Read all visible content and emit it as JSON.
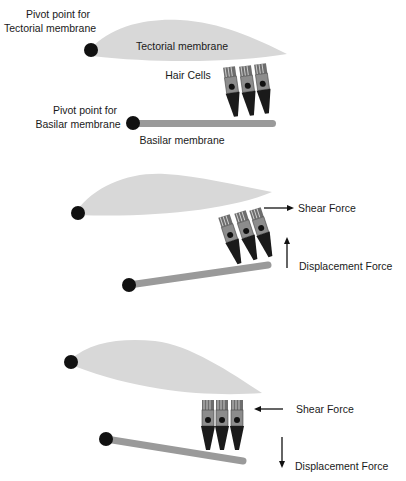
{
  "panel1": {
    "pivot_tectorial_line1": "Pivot point for",
    "pivot_tectorial_line2": "Tectorial membrane",
    "tectorial_label": "Tectorial membrane",
    "hair_cells_label": "Hair Cells",
    "pivot_basilar_line1": "Pivot point for",
    "pivot_basilar_line2": "Basilar membrane",
    "basilar_label": "Basilar membrane"
  },
  "panel2": {
    "shear_label": "Shear Force",
    "displacement_label": "Displacement Force"
  },
  "panel3": {
    "shear_label": "Shear Force",
    "displacement_label": "Displacement Force"
  },
  "colors": {
    "tectorial": "#d8d8d8",
    "basilar": "#9a9a9a",
    "pivot": "#111111",
    "hair_body": "#1a1a1a",
    "hair_top": "#8a8a8a"
  }
}
